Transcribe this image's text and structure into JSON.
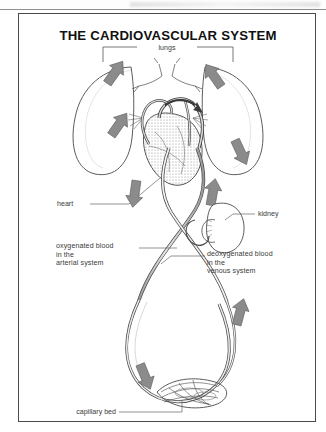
{
  "document": {
    "title": "THE CARDIOVASCULAR SYSTEM",
    "page_background": "#ffffff",
    "frame_color": "#4a4a4a",
    "ink_color": "#333333",
    "arrow_fill": "#8b8b8b",
    "label_color": "#3a3a3a"
  },
  "diagram": {
    "type": "anatomical-illustration",
    "labels": {
      "lungs": "lungs",
      "heart": "heart",
      "kidney": "kidney",
      "capillary_bed": "capillary bed",
      "oxygenated_line1": "oxygenated blood",
      "oxygenated_line2": "in the",
      "oxygenated_line3": "arterial system",
      "deoxygenated_line1": "deoxygenated blood",
      "deoxygenated_line2": "in the",
      "deoxygenated_line3": "venous system"
    },
    "flow_arrows": [
      {
        "name": "left-lung-upper",
        "direction": "down-left"
      },
      {
        "name": "left-lung-lower",
        "direction": "down-left"
      },
      {
        "name": "right-lung-upper",
        "direction": "down-right"
      },
      {
        "name": "right-lung-lower",
        "direction": "up-left"
      },
      {
        "name": "aorta-descending",
        "direction": "down"
      },
      {
        "name": "vena-cava-ascending",
        "direction": "up"
      },
      {
        "name": "systemic-loop-left-down",
        "direction": "down-right"
      },
      {
        "name": "systemic-loop-right-up",
        "direction": "up"
      }
    ]
  }
}
